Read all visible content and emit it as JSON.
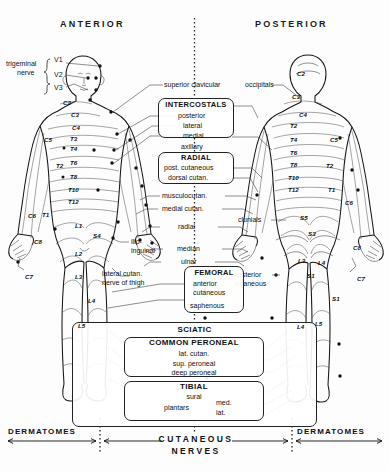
{
  "figure": {
    "headers": {
      "anterior": "ANTERIOR",
      "posterior": "POSTERIOR"
    },
    "footer": {
      "left": "DERMATOMES",
      "right": "DERMATOMES",
      "center_line1": "CUTANEOUS",
      "center_line2": "NERVES"
    },
    "colors": {
      "ink": "#151515",
      "line": "#3a3a3a",
      "paper": "#fdfdfd"
    }
  },
  "trigeminal": {
    "label_line1": "trigeminal",
    "label_line2": "nerve",
    "branches": [
      "V1",
      "V2",
      "V3"
    ]
  },
  "nerve_labels": {
    "superior_clavicular": "superior clavicular",
    "occipitals": "occipitals",
    "musculocutan": "musculocutan.",
    "medial_cutan": "medial cutan.",
    "radial": "radial",
    "median": "median",
    "ulnar": "ulnar",
    "ilio": "ilio-",
    "inguinal": "inguinal",
    "lateral_cutan": "lateral cutan.",
    "nerve_of_thigh": "nerve of thigh",
    "posterior_cutaneous_1": "posterior",
    "posterior_cutaneous_2": "cutaneous",
    "clunials": "clunials"
  },
  "boxes": {
    "intercostals": {
      "title": "INTERCOSTALS",
      "items": [
        "posterior",
        "lateral",
        "medial"
      ],
      "after": "axillary"
    },
    "radial": {
      "title": "RADIAL",
      "items": [
        "post. cutaneous",
        "dorsal cutan."
      ]
    },
    "femoral": {
      "title": "FEMORAL",
      "items": [
        "anterior",
        "cutaneous",
        "saphenous"
      ]
    },
    "sciatic": {
      "title": "SCIATIC"
    },
    "common_peroneal": {
      "title": "COMMON PERONEAL",
      "items": [
        "lat. cutan.",
        "sup. peroneal",
        "deep peroneal"
      ]
    },
    "tibial": {
      "title": "TIBIAL",
      "items": [
        "sural"
      ],
      "plantars_label": "plantars",
      "plantars_branches": [
        "med.",
        "lat."
      ]
    }
  },
  "dermatomes": {
    "anterior": [
      {
        "id": "C2",
        "x": 63,
        "y": 99
      },
      {
        "id": "C3",
        "x": 71,
        "y": 111
      },
      {
        "id": "C4",
        "x": 72,
        "y": 124
      },
      {
        "id": "T3",
        "x": 70,
        "y": 135
      },
      {
        "id": "T4",
        "x": 70,
        "y": 145
      },
      {
        "id": "T6",
        "x": 70,
        "y": 159
      },
      {
        "id": "T8",
        "x": 70,
        "y": 173
      },
      {
        "id": "T10",
        "x": 68,
        "y": 186
      },
      {
        "id": "T12",
        "x": 68,
        "y": 198
      },
      {
        "id": "C5",
        "x": 44,
        "y": 136
      },
      {
        "id": "T2",
        "x": 56,
        "y": 162
      },
      {
        "id": "C6",
        "x": 28,
        "y": 212
      },
      {
        "id": "T1",
        "x": 42,
        "y": 211
      },
      {
        "id": "C8",
        "x": 34,
        "y": 238
      },
      {
        "id": "C7",
        "x": 25,
        "y": 273
      },
      {
        "id": "L1",
        "x": 75,
        "y": 222
      },
      {
        "id": "S4",
        "x": 93,
        "y": 232
      },
      {
        "id": "L2",
        "x": 75,
        "y": 250
      },
      {
        "id": "L3",
        "x": 75,
        "y": 273
      },
      {
        "id": "L4",
        "x": 88,
        "y": 297
      },
      {
        "id": "L5",
        "x": 78,
        "y": 322
      }
    ],
    "posterior": [
      {
        "id": "C2",
        "x": 297,
        "y": 70
      },
      {
        "id": "C3",
        "x": 292,
        "y": 93
      },
      {
        "id": "C4",
        "x": 299,
        "y": 111
      },
      {
        "id": "T2",
        "x": 290,
        "y": 122
      },
      {
        "id": "T4",
        "x": 290,
        "y": 136
      },
      {
        "id": "T6",
        "x": 290,
        "y": 149
      },
      {
        "id": "T8",
        "x": 290,
        "y": 161
      },
      {
        "id": "T10",
        "x": 288,
        "y": 174
      },
      {
        "id": "T12",
        "x": 288,
        "y": 186
      },
      {
        "id": "C5",
        "x": 330,
        "y": 136
      },
      {
        "id": "T2b",
        "x": 326,
        "y": 162,
        "text": "T2"
      },
      {
        "id": "T1",
        "x": 328,
        "y": 186
      },
      {
        "id": "C6",
        "x": 345,
        "y": 199
      },
      {
        "id": "C8",
        "x": 353,
        "y": 244
      },
      {
        "id": "C7",
        "x": 357,
        "y": 275
      },
      {
        "id": "S5",
        "x": 300,
        "y": 214
      },
      {
        "id": "S3",
        "x": 308,
        "y": 230
      },
      {
        "id": "L3",
        "x": 298,
        "y": 257
      },
      {
        "id": "S1",
        "x": 307,
        "y": 272
      },
      {
        "id": "L4",
        "x": 318,
        "y": 259
      },
      {
        "id": "L5",
        "x": 315,
        "y": 320
      },
      {
        "id": "L4b",
        "x": 297,
        "y": 323,
        "text": "L4"
      },
      {
        "id": "S1b",
        "x": 332,
        "y": 295,
        "text": "S1"
      }
    ]
  }
}
